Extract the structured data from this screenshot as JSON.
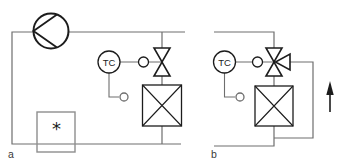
{
  "figure": {
    "colors": {
      "bg": "#ffffff",
      "line": "#6e6e6e",
      "symbol": "#1c1c1c",
      "box": "#8e8e8e",
      "label": "#3a3a3a"
    },
    "diagram_a": {
      "label": "a",
      "controller_label": "TC",
      "cold_box_symbol": "*",
      "components": [
        "compressor",
        "temperature-controller",
        "valve-actuator",
        "two-way-control-valve",
        "heat-exchanger",
        "refrigerated-box",
        "temperature-sensor"
      ]
    },
    "diagram_b": {
      "label": "b",
      "controller_label": "TC",
      "components": [
        "temperature-controller",
        "valve-actuator",
        "three-way-control-valve",
        "heat-exchanger",
        "bypass-line",
        "temperature-sensor",
        "flow-direction-arrow"
      ]
    }
  }
}
